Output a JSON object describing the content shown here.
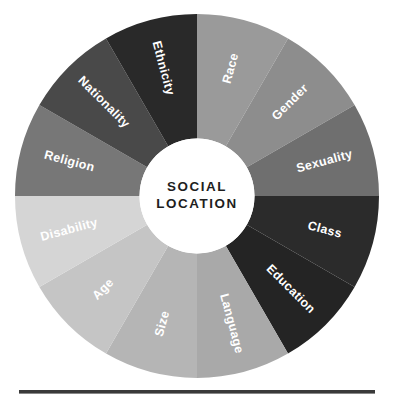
{
  "figure": {
    "name": "social-location-wheel",
    "hub": {
      "line1": "SOCIAL",
      "line2": "LOCATION",
      "fill": "#ffffff",
      "text_color": "#1e1e1e"
    },
    "background": "#ffffff",
    "label_color": "#ffffff",
    "rule": {
      "color": "#3a3a3a"
    }
  },
  "chart_data": {
    "type": "pie",
    "title": "SOCIAL LOCATION",
    "subtitle": "",
    "xlabel": "",
    "ylabel": "",
    "legend_position": "none",
    "grid": false,
    "note": "Twelve equal 30-degree segments of a donut wheel, labelled in place; no numeric values are printed on the figure.",
    "categories": [
      "Race",
      "Gender",
      "Sexuality",
      "Class",
      "Education",
      "Language",
      "Size",
      "Age",
      "Disability",
      "Religion",
      "Nationality",
      "Ethnicity"
    ],
    "values": [
      30,
      30,
      30,
      30,
      30,
      30,
      30,
      30,
      30,
      30,
      30,
      30
    ],
    "value_unit": "degrees",
    "colors": [
      "#9a9a9a",
      "#8d8d8d",
      "#6f6f6f",
      "#2b2b2b",
      "#242424",
      "#a9a9a9",
      "#b5b5b5",
      "#c5c5c5",
      "#d5d5d5",
      "#777777",
      "#494949",
      "#292929"
    ],
    "segments": [
      {
        "label": "Race",
        "color": "#9a9a9a",
        "start_deg": 0,
        "end_deg": 30,
        "mid_deg": 15,
        "text_rotation": 15,
        "flip": false
      },
      {
        "label": "Gender",
        "color": "#8d8d8d",
        "start_deg": 30,
        "end_deg": 60,
        "mid_deg": 45,
        "text_rotation": 45,
        "flip": false
      },
      {
        "label": "Sexuality",
        "color": "#6f6f6f",
        "start_deg": 60,
        "end_deg": 90,
        "mid_deg": 75,
        "text_rotation": 75,
        "flip": false
      },
      {
        "label": "Class",
        "color": "#2b2b2b",
        "start_deg": 90,
        "end_deg": 120,
        "mid_deg": 105,
        "text_rotation": 105,
        "flip": false
      },
      {
        "label": "Education",
        "color": "#242424",
        "start_deg": 120,
        "end_deg": 150,
        "mid_deg": 135,
        "text_rotation": 135,
        "flip": false
      },
      {
        "label": "Language",
        "color": "#a9a9a9",
        "start_deg": 150,
        "end_deg": 180,
        "mid_deg": 165,
        "text_rotation": 165,
        "flip": false
      },
      {
        "label": "Size",
        "color": "#b5b5b5",
        "start_deg": 180,
        "end_deg": 210,
        "mid_deg": 195,
        "text_rotation": 15,
        "flip": true
      },
      {
        "label": "Age",
        "color": "#c5c5c5",
        "start_deg": 210,
        "end_deg": 240,
        "mid_deg": 225,
        "text_rotation": 45,
        "flip": true
      },
      {
        "label": "Disability",
        "color": "#d5d5d5",
        "start_deg": 240,
        "end_deg": 270,
        "mid_deg": 255,
        "text_rotation": 75,
        "flip": true
      },
      {
        "label": "Religion",
        "color": "#777777",
        "start_deg": 270,
        "end_deg": 300,
        "mid_deg": 285,
        "text_rotation": 105,
        "flip": true
      },
      {
        "label": "Nationality",
        "color": "#494949",
        "start_deg": 300,
        "end_deg": 330,
        "mid_deg": 315,
        "text_rotation": 135,
        "flip": true
      },
      {
        "label": "Ethnicity",
        "color": "#292929",
        "start_deg": 330,
        "end_deg": 360,
        "mid_deg": 345,
        "text_rotation": 165,
        "flip": true
      }
    ]
  }
}
